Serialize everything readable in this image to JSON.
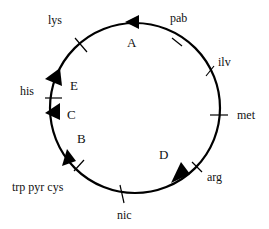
{
  "diagram": {
    "type": "circular genetic map",
    "stroke_color": "#000000",
    "background": "#ffffff",
    "circle": {
      "cx": 135,
      "cy": 108,
      "r": 85
    },
    "gene_markers": [
      {
        "label": "pab",
        "angle": -58
      },
      {
        "label": "ilv",
        "angle": -27
      },
      {
        "label": "met",
        "angle": 0
      },
      {
        "label": "arg",
        "angle": 42
      },
      {
        "label": "nic",
        "angle": 95
      },
      {
        "label": "trp pyr cys",
        "angle": 140
      },
      {
        "label": "his",
        "angle": 186
      },
      {
        "label": "lys",
        "angle": 229
      }
    ],
    "segment_labels": [
      {
        "label": "A"
      },
      {
        "label": "B"
      },
      {
        "label": "C"
      },
      {
        "label": "D"
      },
      {
        "label": "E"
      }
    ],
    "arrowheads": [
      {
        "name": "arrow-top",
        "angle": -89,
        "direction": "counterclockwise"
      },
      {
        "name": "arrow-upper-left",
        "angle": 204,
        "direction": "clockwise"
      },
      {
        "name": "arrow-left",
        "angle": 173,
        "direction": "counterclockwise"
      },
      {
        "name": "arrow-lower-left",
        "angle": 148,
        "direction": "clockwise"
      },
      {
        "name": "arrow-lower-right",
        "angle": 63,
        "direction": "clockwise"
      }
    ]
  }
}
